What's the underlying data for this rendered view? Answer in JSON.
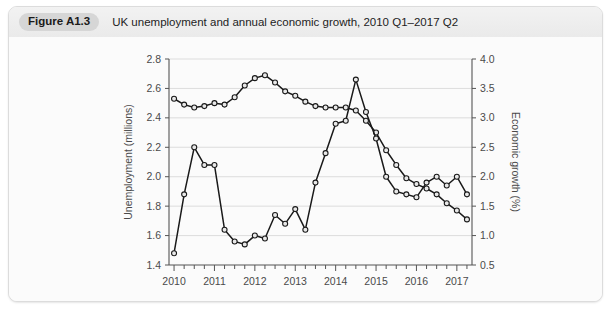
{
  "figure": {
    "label": "Figure A1.3",
    "caption": "UK unemployment and annual economic growth, 2010 Q1–2017 Q2"
  },
  "chart_data": {
    "type": "line",
    "title": "UK unemployment and annual economic growth, 2010 Q1–2017 Q2",
    "xlabel": "",
    "ylabel": "Unemployment (millions)",
    "y2label": "Economic growth (%)",
    "ylim": [
      1.4,
      2.8
    ],
    "y2lim": [
      0.5,
      4.0
    ],
    "xlim": [
      "2010 Q1",
      "2017 Q2"
    ],
    "grid": true,
    "legend": "none",
    "x_tick_labels": [
      "2010",
      "2011",
      "2012",
      "2013",
      "2014",
      "2015",
      "2016",
      "2017"
    ],
    "y_tick_labels": [
      "1.4",
      "1.6",
      "1.8",
      "2.0",
      "2.2",
      "2.4",
      "2.6",
      "2.8"
    ],
    "y2_tick_labels": [
      "0.5",
      "1.0",
      "1.5",
      "2.0",
      "2.5",
      "3.0",
      "3.5",
      "4.0"
    ],
    "x": [
      "2010 Q1",
      "2010 Q2",
      "2010 Q3",
      "2010 Q4",
      "2011 Q1",
      "2011 Q2",
      "2011 Q3",
      "2011 Q4",
      "2012 Q1",
      "2012 Q2",
      "2012 Q3",
      "2012 Q4",
      "2013 Q1",
      "2013 Q2",
      "2013 Q3",
      "2013 Q4",
      "2014 Q1",
      "2014 Q2",
      "2014 Q3",
      "2014 Q4",
      "2015 Q1",
      "2015 Q2",
      "2015 Q3",
      "2015 Q4",
      "2016 Q1",
      "2016 Q2",
      "2016 Q3",
      "2016 Q4",
      "2017 Q1",
      "2017 Q2"
    ],
    "series": [
      {
        "name": "Unemployment (millions)",
        "axis": "left",
        "unit": "millions",
        "values": [
          2.53,
          2.49,
          2.47,
          2.48,
          2.5,
          2.49,
          2.54,
          2.62,
          2.67,
          2.69,
          2.64,
          2.58,
          2.55,
          2.51,
          2.48,
          2.47,
          2.47,
          2.47,
          2.45,
          2.38,
          2.3,
          2.18,
          2.08,
          1.99,
          1.95,
          1.92,
          1.88,
          1.82,
          1.77,
          1.71
        ]
      },
      {
        "name": "Economic growth (%)",
        "axis": "right",
        "unit": "%",
        "values": [
          0.7,
          1.7,
          2.5,
          2.2,
          2.2,
          1.1,
          0.9,
          0.85,
          1.0,
          0.95,
          1.35,
          1.2,
          1.45,
          1.1,
          1.9,
          2.4,
          2.9,
          2.95,
          3.65,
          3.1,
          2.65,
          2.0,
          1.75,
          1.7,
          1.65,
          1.9,
          2.0,
          1.85,
          2.0,
          1.7
        ]
      }
    ]
  }
}
